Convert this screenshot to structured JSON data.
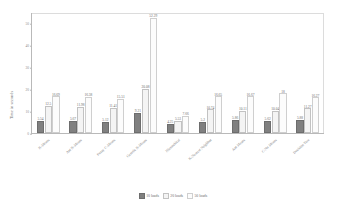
{
  "chart_data": {
    "type": "bar",
    "title": "",
    "xlabel": "",
    "ylabel": "Time in seconds",
    "ylim": [
      0,
      55
    ],
    "yticks": [
      0,
      10,
      20,
      30,
      40,
      50
    ],
    "grid": false,
    "legend_position": "bottom",
    "categories": [
      "K-Means",
      "Ant K-Means",
      "Fuzzy C-Means",
      "Genetic K-Means",
      "Hierarchical",
      "K-Nearest Neighbor",
      "Ant Means",
      "C-Nn Means",
      "Decision Tree"
    ],
    "series": [
      {
        "name": "10 loads",
        "values": [
          5.54,
          5.67,
          5.12,
          9.21,
          4.25,
          5.2,
          5.86,
          5.62,
          5.88
        ]
      },
      {
        "name": "20 loads",
        "values": [
          12.5,
          11.98,
          11.41,
          20.08,
          5.53,
          10.74,
          10.11,
          10.04,
          11.27
        ]
      },
      {
        "name": "50 loads",
        "values": [
          16.69,
          16.38,
          15.51,
          52.29,
          7.66,
          16.65,
          16.67,
          18.0,
          16.27
        ]
      }
    ],
    "value_labels": [
      [
        "5.54",
        "12.5",
        "16.69"
      ],
      [
        "5.67",
        "11.98",
        "16.38"
      ],
      [
        "5.12",
        "11.41",
        "15.51"
      ],
      [
        "9.21",
        "20.08",
        "52.29"
      ],
      [
        "4.25",
        "5.53",
        "7.66"
      ],
      [
        "5.2",
        "10.74",
        "16.65"
      ],
      [
        "5.86",
        "10.11",
        "16.67"
      ],
      [
        "5.62",
        "10.04",
        "18"
      ],
      [
        "5.88",
        "11.27",
        "16.27"
      ]
    ],
    "colors": {
      "series_10_loads": "#808080",
      "series_20_loads": "#f4f4f4",
      "series_50_loads": "#fcfcfc",
      "axis": "#b9b9b9",
      "text": "#6b6b6b"
    }
  }
}
